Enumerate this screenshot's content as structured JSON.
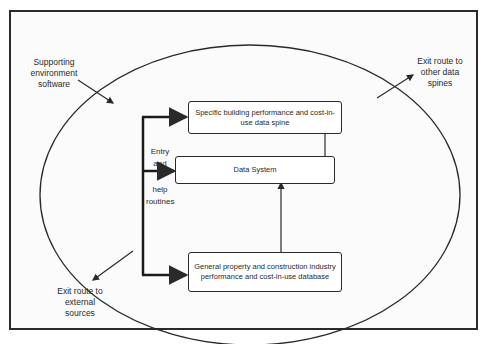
{
  "diagram": {
    "outer_labels": {
      "supporting_env": "Supporting environment software",
      "exit_other_spines": "Exit route to other data spines",
      "exit_external": "Exit route to external sources"
    },
    "entry_label": {
      "line1": "Entry",
      "line2": "and",
      "line3": "help",
      "line4": "routines"
    },
    "boxes": {
      "specific": "Specific building performance and cost-in-use data spine",
      "data_system": "Data System",
      "general": "General property and construction industry performance and cost-in-use database"
    }
  }
}
